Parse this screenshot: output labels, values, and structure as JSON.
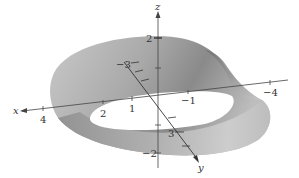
{
  "figure": {
    "surface": {
      "name": "Möbius strip",
      "color_light": "#d9d9d9",
      "color_mid": "#b3b3b3",
      "color_dark": "#7a7a7a",
      "hole_color": "#ffffff"
    },
    "axes": {
      "x": {
        "label": "x",
        "ticks": [
          {
            "value": "4",
            "pos": [
              43,
              117
            ]
          },
          {
            "value": "2",
            "pos": [
              103,
              112
            ]
          },
          {
            "value": "1",
            "pos": [
              132,
              107
            ]
          },
          {
            "value": "−1",
            "pos": [
              188,
              100
            ]
          },
          {
            "value": "−4",
            "pos": [
              270,
              93
            ]
          }
        ]
      },
      "y": {
        "label": "y",
        "ticks": [
          {
            "value": "−3",
            "pos": [
              121,
              66
            ]
          },
          {
            "value": "3",
            "pos": [
              171,
              135
            ]
          }
        ]
      },
      "z": {
        "label": "z",
        "ticks": [
          {
            "value": "2",
            "pos": [
              147,
              41
            ]
          },
          {
            "value": "−2",
            "pos": [
              146,
              157
            ]
          }
        ]
      }
    }
  }
}
